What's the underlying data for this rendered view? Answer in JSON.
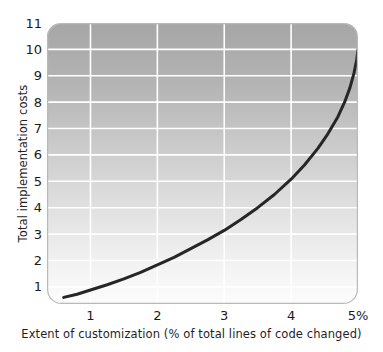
{
  "chart_data": {
    "type": "line",
    "title": "",
    "subtitle": "",
    "xlabel": "Extent of customization (% of total lines of code changed)",
    "ylabel": "Total implementation costs",
    "xlim": [
      0.35,
      5.0
    ],
    "ylim": [
      0.35,
      11.0
    ],
    "xticks": [
      1,
      2,
      3,
      4,
      5
    ],
    "xtick_labels": [
      "1",
      "2",
      "3",
      "4",
      "5%"
    ],
    "yticks": [
      1,
      2,
      3,
      4,
      5,
      6,
      7,
      8,
      9,
      10,
      11
    ],
    "ytick_labels": [
      "1",
      "2",
      "3",
      "4",
      "5",
      "6",
      "7",
      "8",
      "9",
      "10",
      "11"
    ],
    "grid": true,
    "grid_color": "#ffffff",
    "legend": null,
    "legend_position": "none",
    "plot_background": {
      "gradient_from": "#a6a6a6",
      "gradient_to": "#fbfbfb",
      "direction": "top-to-bottom",
      "border_color": "#b5b5b5",
      "corner_radius": 14
    },
    "series": [
      {
        "name": "Total implementation costs",
        "color": "#262626",
        "line_width": 3,
        "x": [
          0.6,
          0.8,
          1.0,
          1.25,
          1.5,
          1.75,
          2.0,
          2.25,
          2.5,
          2.75,
          3.0,
          3.25,
          3.5,
          3.75,
          4.0,
          4.2,
          4.4,
          4.55,
          4.7,
          4.8,
          4.88,
          4.94,
          4.98,
          5.0
        ],
        "y": [
          0.6,
          0.72,
          0.88,
          1.08,
          1.3,
          1.55,
          1.83,
          2.12,
          2.45,
          2.78,
          3.14,
          3.55,
          4.0,
          4.5,
          5.08,
          5.62,
          6.25,
          6.8,
          7.45,
          8.0,
          8.55,
          9.1,
          9.6,
          10.0
        ]
      }
    ]
  },
  "axis": {
    "y_title": "Total implementation costs",
    "x_title": "Extent of customization (% of total lines of code changed)",
    "y_tick_labels": [
      "11",
      "10",
      "9",
      "8",
      "7",
      "6",
      "5",
      "4",
      "3",
      "2",
      "1"
    ],
    "x_tick_labels": [
      "1",
      "2",
      "3",
      "4",
      "5%"
    ]
  }
}
